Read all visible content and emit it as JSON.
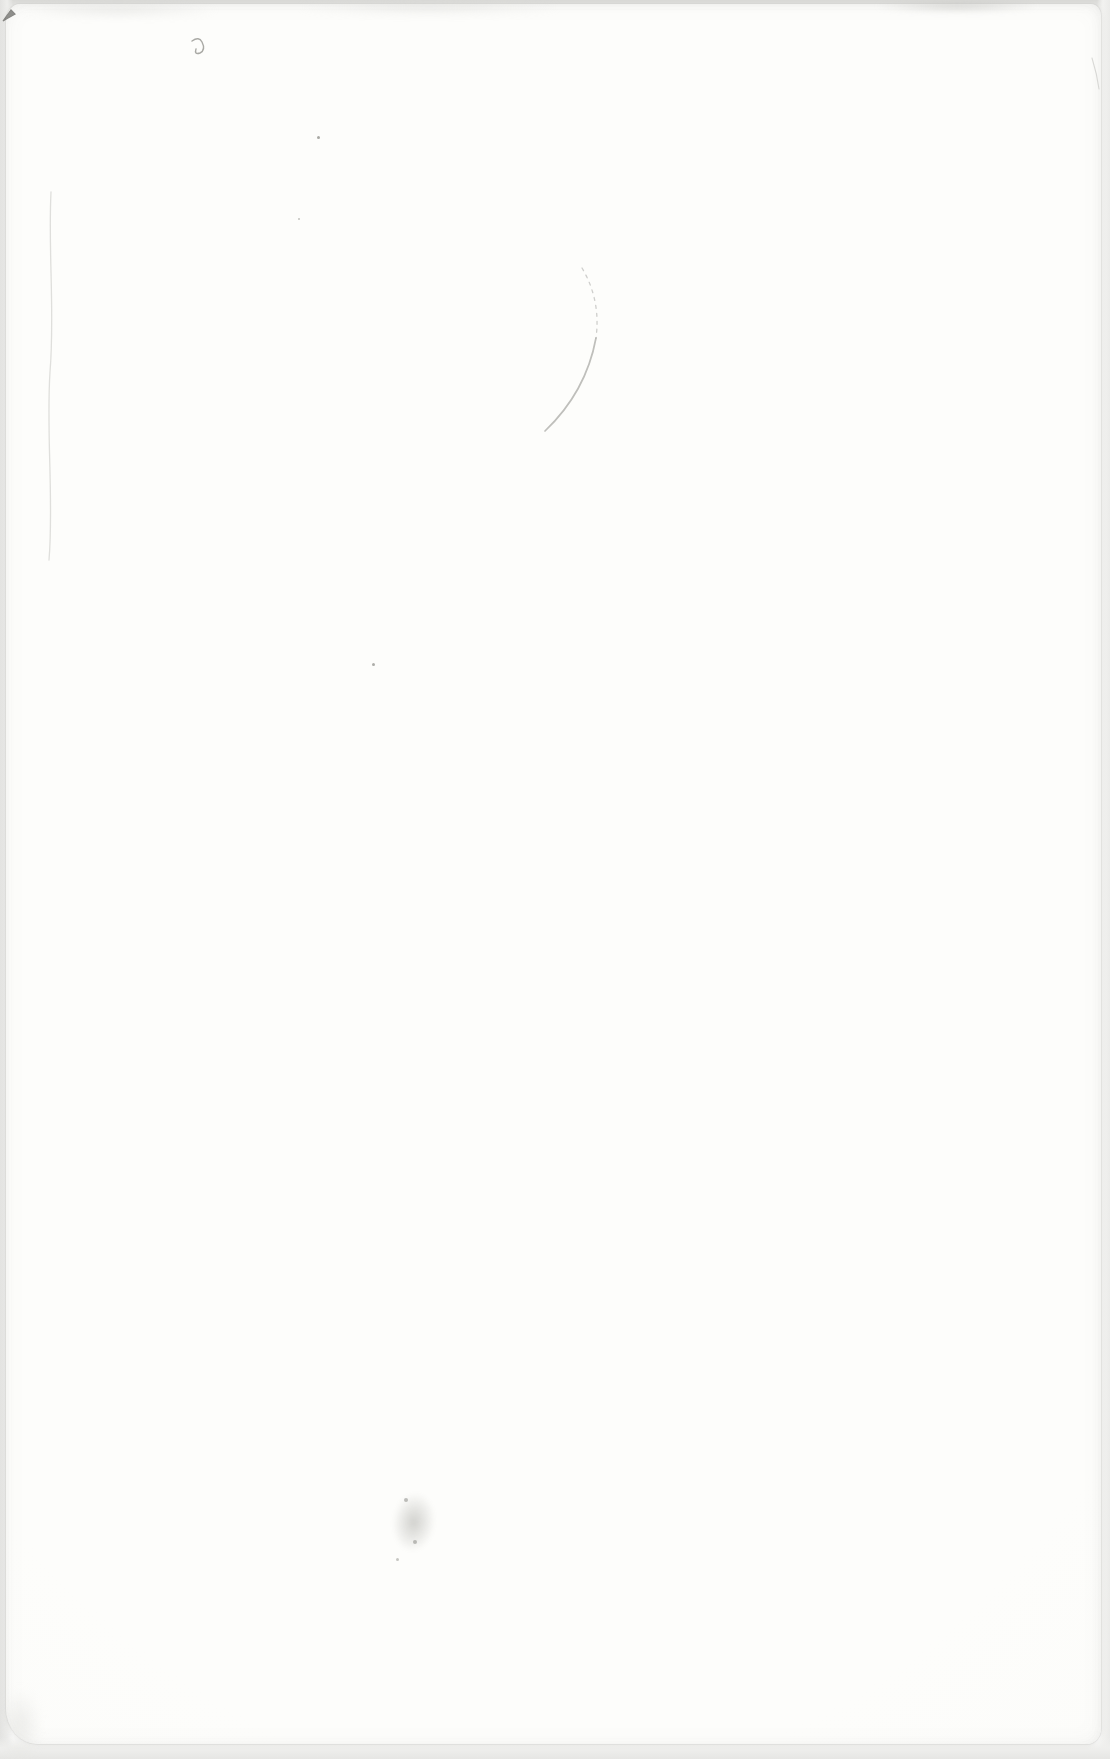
{
  "document": {
    "kind": "scanned-blank-book-page",
    "visible_text": ""
  },
  "colors": {
    "scanner_bed": "#ffffff",
    "paper": "#fcfcfa",
    "paper_edge_shade": "#e9e9e7",
    "top_edge_band": "#d9d9d6",
    "mark_dark": "#63635f",
    "mark_medium": "#96968f",
    "mark_light": "#c6c6c2"
  },
  "marks": [
    {
      "name": "corner-tick-mark",
      "type": "svg-path",
      "path": "M3,21 L11,10 L15,14 L8,18 Z",
      "stroke": "#63635f",
      "fill": "#6d6d69",
      "stroke_width": 1.2,
      "opacity": 0.75
    },
    {
      "name": "top-edge-squiggle",
      "type": "svg-path",
      "path": "M192,41 q7,-5 10,1 q4,8 -2,11 q-6,2 -4,-4",
      "stroke": "#84847f",
      "fill": "none",
      "stroke_width": 1.4,
      "opacity": 0.7
    },
    {
      "name": "curved-scratch-upper",
      "type": "svg-path",
      "path": "M582,268 Q601,300 596,338",
      "stroke": "#b6b6b2",
      "fill": "none",
      "stroke_width": 1.3,
      "opacity": 0.65,
      "dash": "3 5"
    },
    {
      "name": "curved-scratch-lower",
      "type": "svg-path",
      "path": "M596,338 Q586,392 545,431",
      "stroke": "#a4a49f",
      "fill": "none",
      "stroke_width": 1.7,
      "opacity": 0.7
    },
    {
      "name": "left-crease-line",
      "type": "svg-path",
      "path": "M51,192 C48,252 55,312 50,372 C46,432 54,502 49,560",
      "stroke": "#dcdcd8",
      "fill": "none",
      "stroke_width": 1.3,
      "opacity": 0.9
    },
    {
      "name": "right-edge-scratch",
      "type": "svg-path",
      "path": "M1092,58 q5,16 7,31",
      "stroke": "#cbcbc7",
      "fill": "none",
      "stroke_width": 1.1,
      "opacity": 0.7
    },
    {
      "name": "dust-speck-1",
      "type": "speck",
      "x": 317,
      "y": 136,
      "size": 3,
      "color": "#8c8c87",
      "opacity": 0.75
    },
    {
      "name": "dust-speck-2",
      "type": "speck",
      "x": 298,
      "y": 218,
      "size": 2,
      "color": "#a3a39e",
      "opacity": 0.65
    },
    {
      "name": "dust-speck-3",
      "type": "speck",
      "x": 372,
      "y": 663,
      "size": 3,
      "color": "#8c8c87",
      "opacity": 0.7
    },
    {
      "name": "pencil-smudge",
      "type": "smudge",
      "x": 386,
      "y": 1486,
      "width": 54,
      "height": 86,
      "color": "#8b8b85",
      "opacity": 0.38
    },
    {
      "name": "smudge-fleck-1",
      "type": "speck",
      "x": 404,
      "y": 1498,
      "size": 4,
      "color": "#757570",
      "opacity": 0.45
    },
    {
      "name": "smudge-fleck-2",
      "type": "speck",
      "x": 413,
      "y": 1540,
      "size": 4,
      "color": "#757570",
      "opacity": 0.45
    },
    {
      "name": "smudge-fleck-3",
      "type": "speck",
      "x": 396,
      "y": 1558,
      "size": 3,
      "color": "#83837d",
      "opacity": 0.45
    },
    {
      "name": "top-right-gray-band",
      "type": "blob",
      "x": 876,
      "y": 0,
      "width": 162,
      "height": 12,
      "color": "#c2c2bf",
      "opacity": 0.65,
      "blur": 3
    },
    {
      "name": "top-center-edge-mottle",
      "type": "blob",
      "x": 298,
      "y": 0,
      "width": 262,
      "height": 14,
      "color": "#d6d6d3",
      "opacity": 0.5,
      "blur": 4
    },
    {
      "name": "top-left-edge-mottle",
      "type": "blob",
      "x": 18,
      "y": 2,
      "width": 200,
      "height": 15,
      "color": "#d3d3d0",
      "opacity": 0.45,
      "blur": 4
    },
    {
      "name": "bottom-left-corner-shade",
      "type": "blob",
      "x": 0,
      "y": 1690,
      "width": 40,
      "height": 70,
      "color": "#dededb",
      "opacity": 0.55,
      "blur": 6
    }
  ]
}
